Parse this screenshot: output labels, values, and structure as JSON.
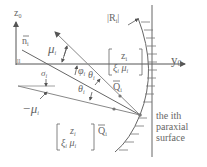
{
  "diagram": {
    "axes": {
      "vertical_label": "z",
      "vertical_sub": "0",
      "horizontal_label": "y",
      "horizontal_sub": "0",
      "origin_mark": "ll"
    },
    "labels": {
      "normal": "n",
      "normal_sub": "i",
      "radius": "|R",
      "radius_sub": "i",
      "radius_close": "|",
      "mu": "μ",
      "mu_sub": "i",
      "phi": "φ",
      "phi_sub": "i",
      "theta": "θ",
      "theta_sub": "i",
      "theta_prime": "θ",
      "theta_prime_sub": "i",
      "theta_prime_mark": "'",
      "sigma": "σ",
      "sigma_sub": "i",
      "neg_mu_prime": "−μ",
      "neg_mu_prime_sub": "i",
      "neg_mu_prime_mark": "'",
      "Q": "Q",
      "Q_sub": "i",
      "Q_prime": "Q",
      "Q_prime_sub": "i",
      "Q_prime_mark": "'",
      "vec_top": {
        "line1": "z",
        "line1_sub": "i",
        "line2a": "ξ",
        "line2a_sub": "i",
        "line2b": "μ",
        "line2b_sub": "i"
      },
      "vec_bottom": {
        "line1": "z",
        "line1_sub": "i",
        "line2a": "ξ",
        "line2a_sub": "i",
        "line2b": "μ",
        "line2b_sub": "i",
        "mark": "'"
      },
      "surface_caption": [
        "the ith",
        "paraxial",
        "surface"
      ]
    },
    "colors": {
      "line": "#666666",
      "light_line": "#999999",
      "dot": "#777777"
    }
  }
}
